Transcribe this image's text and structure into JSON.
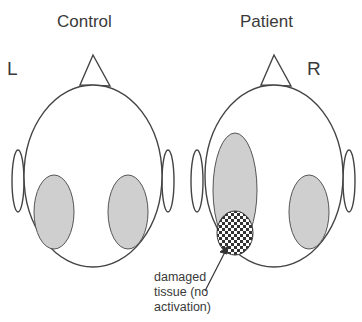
{
  "titles": {
    "control": "Control",
    "patient": "Patient"
  },
  "sides": {
    "left": "L",
    "right": "R"
  },
  "annotation": {
    "lines": [
      "damaged",
      "tissue (no",
      "activation)"
    ]
  },
  "colors": {
    "outline": "#444444",
    "activation": "#cfcfcf",
    "background": "#ffffff",
    "checker_dark": "#333333"
  },
  "heads": [
    {
      "name": "control",
      "cx": 93,
      "cy": 176,
      "rx": 69,
      "ry": 91,
      "activation": [
        "left",
        "right"
      ],
      "damage": false
    },
    {
      "name": "patient",
      "cx": 274,
      "cy": 176,
      "rx": 69,
      "ry": 91,
      "activation": [
        "left",
        "right"
      ],
      "damage": true
    }
  ]
}
